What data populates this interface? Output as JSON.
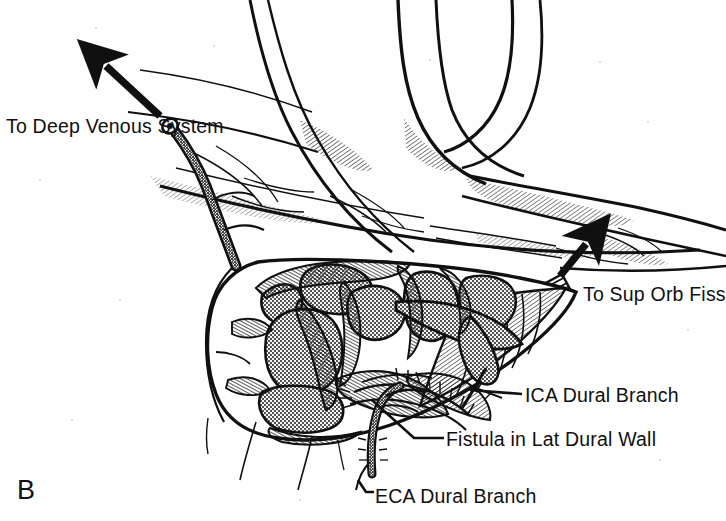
{
  "figure": {
    "panel_letter": "B",
    "caption_labels": {
      "deep_venous": "To Deep Venous System",
      "sup_orb_fiss": "To Sup Orb Fiss",
      "ica_dural_branch": "ICA Dural Branch",
      "fistula": "Fistula in Lat Dural Wall",
      "eca_dural_branch": "ECA Dural Branch"
    },
    "icons": {
      "arrow_up_left": "arrow-up-left-icon",
      "arrow_up_right": "arrow-up-right-icon"
    },
    "colors": {
      "ink": "#101010",
      "background": "#fefefe",
      "venous_stipple": "#9a9a9a",
      "stipple_dark": "#6f6f6f"
    },
    "structures": [
      "cavernous sinus venous compartments",
      "dural trabeculae",
      "lateral dural wall",
      "internal carotid artery dural branch",
      "external carotid artery dural branch",
      "arteriovenous fistula in lateral dural wall",
      "draining vein to deep venous system",
      "draining vein to superior orbital fissure",
      "cranial nerves crossing superiorly"
    ]
  }
}
